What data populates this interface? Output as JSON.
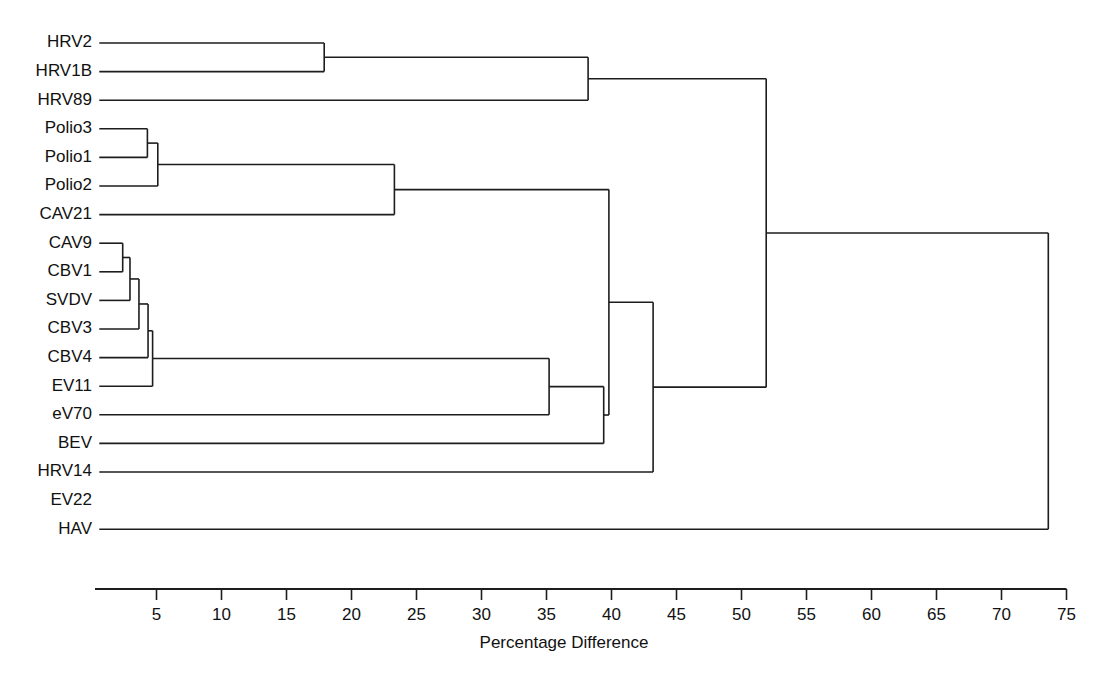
{
  "figure": {
    "name": "dendrogram",
    "background_color": "#ffffff",
    "line_color": "#1d1d1d",
    "text_color": "#111111"
  },
  "chart_data": {
    "type": "dendrogram",
    "title": "",
    "xlabel": "Percentage Difference",
    "ylabel": "",
    "xlim": [
      0,
      75
    ],
    "grid": false,
    "legend": null,
    "orientation": "horizontal-left-to-right",
    "tick_labels": [
      "5",
      "10",
      "15",
      "20",
      "25",
      "30",
      "35",
      "40",
      "45",
      "50",
      "55",
      "60",
      "65",
      "70",
      "75"
    ],
    "tick_values": [
      5,
      10,
      15,
      20,
      25,
      30,
      35,
      40,
      45,
      50,
      55,
      60,
      65,
      70,
      75
    ],
    "tick_step": 5,
    "leaf_labels": [
      "HRV2",
      "HRV1B",
      "HRV89",
      "Polio3",
      "Polio1",
      "Polio2",
      "CAV21",
      "CAV9",
      "CBV1",
      "SVDV",
      "CBV3",
      "CBV4",
      "EV11",
      "eV70",
      "BEV",
      "HRV14",
      "EV22",
      "HAV"
    ],
    "leaf_has_branch": [
      true,
      true,
      true,
      true,
      true,
      true,
      true,
      true,
      true,
      true,
      true,
      true,
      true,
      true,
      true,
      true,
      false,
      true
    ],
    "leaf_start_value": 0.6,
    "merges": [
      {
        "name": "HRV2+HRV1B",
        "children": [
          "HRV2",
          "HRV1B"
        ],
        "value": 17.9
      },
      {
        "name": "HRV-A+HRV89",
        "children": [
          "HRV2+HRV1B",
          "HRV89"
        ],
        "value": 38.2
      },
      {
        "name": "Polio3+Polio1",
        "children": [
          "Polio3",
          "Polio1"
        ],
        "value": 4.3
      },
      {
        "name": "Polio-cluster",
        "children": [
          "Polio3+Polio1",
          "Polio2"
        ],
        "value": 5.1
      },
      {
        "name": "Polio+CAV21",
        "children": [
          "Polio-cluster",
          "CAV21"
        ],
        "value": 23.3
      },
      {
        "name": "CAV9+CBV1",
        "children": [
          "CAV9",
          "CBV1"
        ],
        "value": 2.4
      },
      {
        "name": "CAV9CBV1+SVDV",
        "children": [
          "CAV9+CBV1",
          "SVDV"
        ],
        "value": 2.96
      },
      {
        "name": "+CBV3",
        "children": [
          "CAV9CBV1+SVDV",
          "CBV3"
        ],
        "value": 3.65
      },
      {
        "name": "+CBV4",
        "children": [
          "+CBV3",
          "CBV4"
        ],
        "value": 4.35
      },
      {
        "name": "+EV11",
        "children": [
          "+CBV4",
          "EV11"
        ],
        "value": 4.7
      },
      {
        "name": "CBV-group+eV70",
        "children": [
          "+EV11",
          "eV70"
        ],
        "value": 35.2
      },
      {
        "name": "+BEV",
        "children": [
          "CBV-group+eV70",
          "BEV"
        ],
        "value": 39.4
      },
      {
        "name": "EV-cluster+Polio-cluster",
        "children": [
          "Polio+CAV21",
          "+BEV"
        ],
        "value": 39.8
      },
      {
        "name": "+HRV14",
        "children": [
          "EV-cluster+Polio-cluster",
          "HRV14"
        ],
        "value": 43.2
      },
      {
        "name": "Picornavirus-core",
        "children": [
          "HRV-A+HRV89",
          "+HRV14"
        ],
        "value": 51.9
      },
      {
        "name": "Root+HAV",
        "children": [
          "Picornavirus-core",
          "HAV"
        ],
        "value": 73.6
      }
    ]
  }
}
